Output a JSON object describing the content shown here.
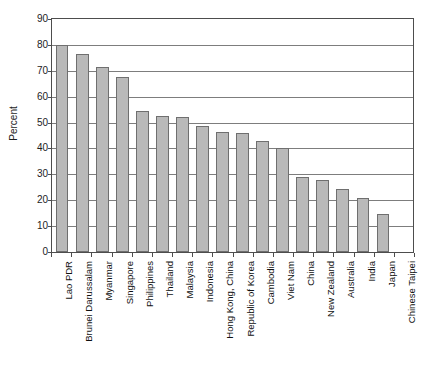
{
  "chart_data": {
    "type": "bar",
    "title": "",
    "xlabel": "",
    "ylabel": "Percent",
    "ylim": [
      0,
      90
    ],
    "ytick_step": 10,
    "yticks": [
      90,
      80,
      70,
      60,
      50,
      40,
      30,
      20,
      10,
      0
    ],
    "grid": true,
    "legend": "none",
    "bar_color": "#b9b9b9",
    "bar_border_color": "#6f6f6f",
    "axis_color": "#4d4d4d",
    "categories": [
      "Lao PDR",
      "Brunei Darussalam",
      "Myanmar",
      "Singapore",
      "Philippines",
      "Thailand",
      "Malaysia",
      "Indonesia",
      "Hong Kong, China",
      "Republic of Korea",
      "Cambodia",
      "Viet Nam",
      "China",
      "New Zealand",
      "Australia",
      "India",
      "Japan",
      "Chinese Taipei"
    ],
    "values": [
      80,
      76.5,
      71.5,
      67.5,
      54.5,
      52.5,
      52,
      48.5,
      46.5,
      46,
      43,
      40,
      29,
      28,
      24.5,
      21,
      14.5,
      0
    ]
  },
  "artifact": {
    "top_strip_text": ""
  }
}
